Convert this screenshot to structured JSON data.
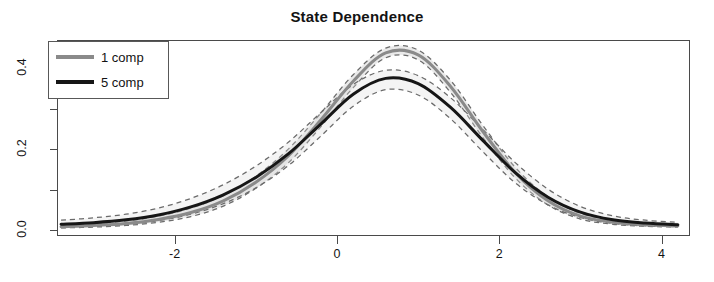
{
  "chart_data": {
    "type": "line",
    "title": "State Dependence",
    "subtitle": "",
    "xlabel": "",
    "ylabel": "",
    "xlim": [
      -3.45,
      4.35
    ],
    "ylim": [
      -0.015,
      0.47
    ],
    "grid": false,
    "legend_position": "top-left",
    "xticks": [
      -2,
      0,
      2,
      4
    ],
    "xtick_labels": [
      "-2",
      "0",
      "2",
      "4"
    ],
    "yticks": [
      0.0,
      0.2,
      0.4
    ],
    "ytick_labels": [
      "0.0",
      "0.2",
      "0.4"
    ],
    "ytick_minor": [
      0.1,
      0.3
    ],
    "x": [
      -3.4,
      -3.0,
      -2.6,
      -2.2,
      -1.8,
      -1.4,
      -1.0,
      -0.6,
      -0.2,
      0.2,
      0.6,
      1.0,
      1.4,
      1.8,
      2.2,
      2.6,
      3.0,
      3.4,
      3.8,
      4.2
    ],
    "series": [
      {
        "name": "1 comp",
        "color": "#8a8a8a",
        "linewidth": 3,
        "style": "solid",
        "values": [
          0.008,
          0.011,
          0.016,
          0.026,
          0.043,
          0.072,
          0.118,
          0.183,
          0.272,
          0.368,
          0.438,
          0.433,
          0.355,
          0.243,
          0.141,
          0.072,
          0.034,
          0.019,
          0.013,
          0.01
        ],
        "band_upper": [
          0.012,
          0.016,
          0.022,
          0.034,
          0.054,
          0.085,
          0.133,
          0.2,
          0.289,
          0.384,
          0.45,
          0.445,
          0.37,
          0.258,
          0.154,
          0.082,
          0.041,
          0.024,
          0.017,
          0.014
        ],
        "band_lower": [
          0.005,
          0.007,
          0.011,
          0.019,
          0.033,
          0.059,
          0.103,
          0.166,
          0.255,
          0.352,
          0.426,
          0.421,
          0.34,
          0.228,
          0.128,
          0.062,
          0.027,
          0.014,
          0.009,
          0.007
        ]
      },
      {
        "name": "5 comp",
        "color": "#161616",
        "linewidth": 3,
        "style": "solid",
        "values": [
          0.014,
          0.018,
          0.025,
          0.037,
          0.057,
          0.087,
          0.13,
          0.188,
          0.262,
          0.336,
          0.375,
          0.362,
          0.303,
          0.221,
          0.141,
          0.081,
          0.044,
          0.025,
          0.017,
          0.013
        ],
        "band_upper": [
          0.024,
          0.03,
          0.039,
          0.054,
          0.078,
          0.112,
          0.158,
          0.217,
          0.29,
          0.36,
          0.395,
          0.382,
          0.327,
          0.248,
          0.166,
          0.101,
          0.058,
          0.035,
          0.024,
          0.019
        ],
        "band_lower": [
          0.006,
          0.009,
          0.014,
          0.023,
          0.039,
          0.065,
          0.104,
          0.159,
          0.232,
          0.306,
          0.347,
          0.334,
          0.275,
          0.193,
          0.116,
          0.062,
          0.031,
          0.016,
          0.01,
          0.008
        ]
      }
    ],
    "band_style": "dashed",
    "band_fill": "#d9d9d9"
  },
  "legend": {
    "entries": [
      {
        "label": "1 comp",
        "color": "#8a8a8a"
      },
      {
        "label": "5 comp",
        "color": "#161616"
      }
    ]
  },
  "axes": {
    "x_ticks": [
      {
        "label": "-2",
        "value": -2
      },
      {
        "label": "0",
        "value": 0
      },
      {
        "label": "2",
        "value": 2
      },
      {
        "label": "4",
        "value": 4
      }
    ],
    "y_ticks": [
      {
        "label": "0.0",
        "value": 0.0
      },
      {
        "label": "0.2",
        "value": 0.2
      },
      {
        "label": "0.4",
        "value": 0.4
      }
    ]
  },
  "colors": {
    "series_1": "#8a8a8a",
    "series_2": "#161616",
    "axis": "#4a4a4a",
    "band_fill": "#d9d9d9",
    "band_line": "#6b6b6b",
    "background": "#ffffff"
  }
}
